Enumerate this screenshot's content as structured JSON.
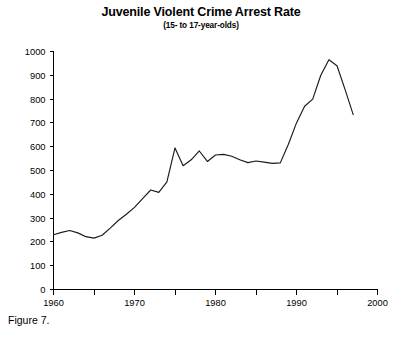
{
  "figure": {
    "caption": "Figure 7."
  },
  "chart_data": {
    "type": "line",
    "title": "Juvenile Violent Crime Arrest Rate",
    "subtitle": "(15- to 17-year-olds)",
    "xlabel": "",
    "ylabel": "",
    "xlim": [
      1960,
      2000
    ],
    "ylim": [
      0,
      1000
    ],
    "grid": false,
    "legend": false,
    "x_ticks": [
      1960,
      1970,
      1980,
      1990,
      2000
    ],
    "x_tick_labels": [
      "1960",
      "1970",
      "1980",
      "1990",
      "2000"
    ],
    "x_minor_ticks": [
      1965,
      1975,
      1985,
      1995
    ],
    "y_ticks": [
      0,
      100,
      200,
      300,
      400,
      500,
      600,
      700,
      800,
      900,
      1000
    ],
    "y_tick_labels": [
      "0",
      "100",
      "200",
      "300",
      "400",
      "500",
      "600",
      "700",
      "800",
      "900",
      "1000"
    ],
    "series": [
      {
        "name": "Juvenile Violent Crime Arrest Rate",
        "color": "#1a1a1a",
        "x": [
          1960,
          1961,
          1962,
          1963,
          1964,
          1965,
          1966,
          1967,
          1968,
          1969,
          1970,
          1971,
          1972,
          1973,
          1974,
          1975,
          1976,
          1977,
          1978,
          1979,
          1980,
          1981,
          1982,
          1983,
          1984,
          1985,
          1986,
          1987,
          1988,
          1989,
          1990,
          1991,
          1992,
          1993,
          1994,
          1995,
          1996,
          1997
        ],
        "y": [
          230,
          240,
          248,
          238,
          222,
          216,
          228,
          258,
          290,
          316,
          345,
          382,
          418,
          408,
          452,
          595,
          520,
          545,
          582,
          538,
          565,
          568,
          560,
          545,
          533,
          540,
          535,
          530,
          532,
          610,
          700,
          770,
          800,
          900,
          965,
          940,
          840,
          735
        ]
      }
    ]
  }
}
